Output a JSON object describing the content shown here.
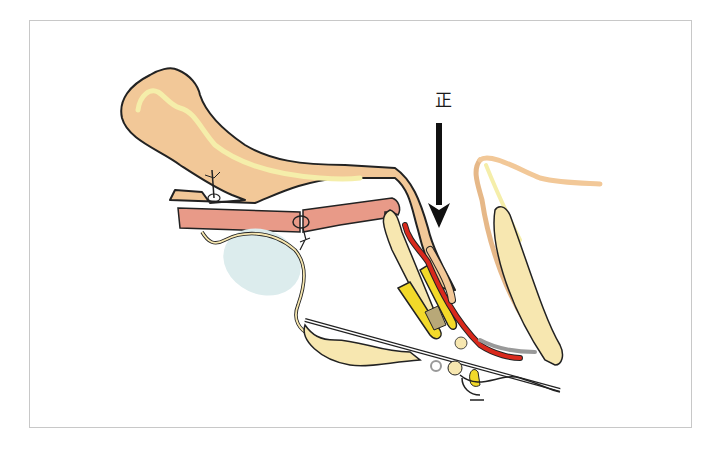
{
  "figure": {
    "type": "anatomical-sagittal-section-diagram",
    "direction_label": "正",
    "arrow": {
      "direction": "down",
      "color": "#111111"
    }
  },
  "colors": {
    "frame_border": "#c8c8c8",
    "skin_tan": "#f2c898",
    "pale_yellow": "#f5eeaa",
    "salmon_muscle": "#e89a88",
    "bone_cream": "#f7e7b0",
    "bright_yellow": "#f2d92a",
    "red_vessel": "#d9291c",
    "cyst_blue": "#dceced",
    "outline": "#222222"
  }
}
